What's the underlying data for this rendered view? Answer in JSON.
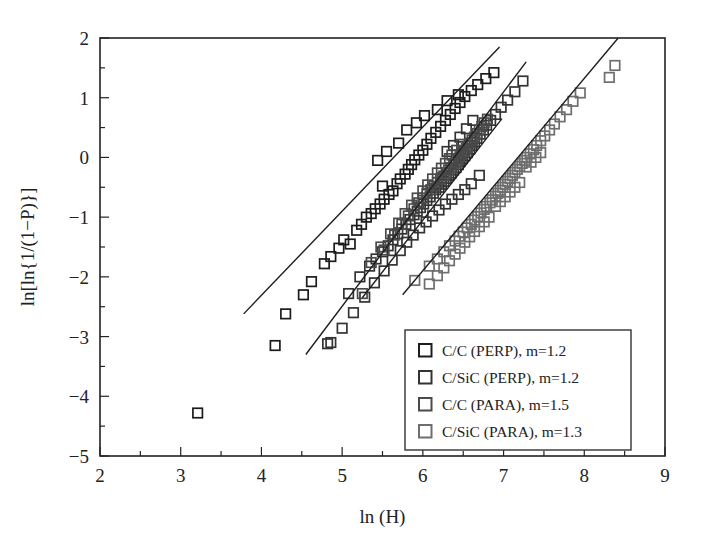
{
  "chart_data": {
    "type": "scatter",
    "title": "",
    "xlabel": "ln (H)",
    "ylabel": "ln[ln{1/(1−P)}]",
    "xlim": [
      2,
      9
    ],
    "ylim": [
      -5,
      2
    ],
    "xticks": [
      2,
      3,
      4,
      5,
      6,
      7,
      8,
      9
    ],
    "yticks": [
      -5,
      -4,
      -3,
      -2,
      -1,
      0,
      1,
      2
    ],
    "xtick_labels": [
      "2",
      "3",
      "4",
      "5",
      "6",
      "7",
      "8",
      "9"
    ],
    "ytick_labels": [
      "−5",
      "−4",
      "−3",
      "−2",
      "−1",
      "0",
      "1",
      "2"
    ],
    "minor_tick_step": 0.5,
    "grid": false,
    "legend_position": "lower-right",
    "marker": "open-square",
    "series": [
      {
        "name": "C/C (PERP), m=1.2",
        "label": "C/C (PERP), m=1.2",
        "weibull_modulus": 1.2,
        "color": "#1c1c1c",
        "fit_line": {
          "x": [
            3.78,
            6.95
          ],
          "y": [
            -2.62,
            1.85
          ],
          "slope": 1.41,
          "intercept": -7.95
        },
        "points": [
          [
            3.21,
            -4.28
          ],
          [
            4.17,
            -3.15
          ],
          [
            4.3,
            -2.62
          ],
          [
            4.52,
            -2.3
          ],
          [
            4.62,
            -2.08
          ],
          [
            4.78,
            -1.78
          ],
          [
            4.86,
            -1.66
          ],
          [
            4.96,
            -1.52
          ],
          [
            5.02,
            -1.38
          ],
          [
            5.1,
            -1.45
          ],
          [
            5.18,
            -1.22
          ],
          [
            5.24,
            -1.12
          ],
          [
            5.3,
            -1.0
          ],
          [
            5.36,
            -0.94
          ],
          [
            5.41,
            -0.86
          ],
          [
            5.47,
            -0.78
          ],
          [
            5.52,
            -0.7
          ],
          [
            5.5,
            -0.48
          ],
          [
            5.58,
            -0.62
          ],
          [
            5.63,
            -0.56
          ],
          [
            5.68,
            -0.44
          ],
          [
            5.72,
            -0.36
          ],
          [
            5.78,
            -0.28
          ],
          [
            5.82,
            -0.2
          ],
          [
            5.86,
            -0.12
          ],
          [
            5.9,
            -0.04
          ],
          [
            5.95,
            0.04
          ],
          [
            6.0,
            0.12
          ],
          [
            6.05,
            0.22
          ],
          [
            6.1,
            0.32
          ],
          [
            6.16,
            0.42
          ],
          [
            6.22,
            0.52
          ],
          [
            6.28,
            0.62
          ],
          [
            6.34,
            0.72
          ],
          [
            6.4,
            0.82
          ],
          [
            6.46,
            0.92
          ],
          [
            6.52,
            1.02
          ],
          [
            6.6,
            1.12
          ],
          [
            6.68,
            1.22
          ],
          [
            6.78,
            1.32
          ],
          [
            6.88,
            1.42
          ],
          [
            6.44,
            1.05
          ],
          [
            6.3,
            0.95
          ],
          [
            6.18,
            0.8
          ],
          [
            6.02,
            0.7
          ],
          [
            5.92,
            0.58
          ],
          [
            5.8,
            0.46
          ],
          [
            5.7,
            0.24
          ],
          [
            5.55,
            0.1
          ],
          [
            5.44,
            -0.05
          ]
        ]
      },
      {
        "name": "C/SiC (PERP), m=1.2",
        "label": "C/SiC (PERP), m=1.2",
        "weibull_modulus": 1.2,
        "color": "#333333",
        "fit_line": {
          "x": [
            4.55,
            7.28
          ],
          "y": [
            -3.3,
            1.6
          ],
          "slope": 1.79,
          "intercept": -11.47
        },
        "points": [
          [
            4.82,
            -3.12
          ],
          [
            5.08,
            -2.28
          ],
          [
            5.22,
            -2.0
          ],
          [
            5.34,
            -1.82
          ],
          [
            5.42,
            -1.7
          ],
          [
            5.5,
            -1.58
          ],
          [
            5.57,
            -1.48
          ],
          [
            5.63,
            -1.38
          ],
          [
            5.69,
            -1.28
          ],
          [
            5.74,
            -1.2
          ],
          [
            5.79,
            -1.12
          ],
          [
            5.84,
            -1.04
          ],
          [
            5.89,
            -0.96
          ],
          [
            5.93,
            -0.9
          ],
          [
            5.97,
            -0.84
          ],
          [
            6.01,
            -0.78
          ],
          [
            6.05,
            -0.72
          ],
          [
            6.09,
            -0.66
          ],
          [
            6.13,
            -0.6
          ],
          [
            6.16,
            -0.54
          ],
          [
            6.2,
            -0.5
          ],
          [
            6.23,
            -0.45
          ],
          [
            6.26,
            -0.4
          ],
          [
            6.29,
            -0.35
          ],
          [
            6.32,
            -0.3
          ],
          [
            6.35,
            -0.26
          ],
          [
            6.38,
            -0.21
          ],
          [
            6.41,
            -0.17
          ],
          [
            6.44,
            -0.12
          ],
          [
            6.46,
            -0.07
          ],
          [
            6.49,
            -0.02
          ],
          [
            6.52,
            0.03
          ],
          [
            6.55,
            0.08
          ],
          [
            6.58,
            0.14
          ],
          [
            6.61,
            0.2
          ],
          [
            6.64,
            0.26
          ],
          [
            6.67,
            0.32
          ],
          [
            6.71,
            0.39
          ],
          [
            6.75,
            0.46
          ],
          [
            6.79,
            0.54
          ],
          [
            6.84,
            0.62
          ],
          [
            6.9,
            0.72
          ],
          [
            6.97,
            0.84
          ],
          [
            7.05,
            0.96
          ],
          [
            7.14,
            1.1
          ],
          [
            7.24,
            1.28
          ],
          [
            6.7,
            -0.3
          ],
          [
            6.6,
            -0.44
          ],
          [
            6.52,
            -0.54
          ],
          [
            6.44,
            -0.62
          ],
          [
            6.36,
            -0.7
          ],
          [
            6.28,
            -0.78
          ],
          [
            6.2,
            -0.88
          ],
          [
            6.12,
            -0.98
          ],
          [
            6.04,
            -1.08
          ],
          [
            5.96,
            -1.18
          ],
          [
            5.88,
            -1.3
          ],
          [
            5.8,
            -1.42
          ],
          [
            5.72,
            -1.56
          ],
          [
            5.62,
            -1.72
          ],
          [
            5.52,
            -1.9
          ],
          [
            5.4,
            -2.1
          ],
          [
            5.28,
            -2.34
          ],
          [
            5.14,
            -2.6
          ],
          [
            5.0,
            -2.86
          ],
          [
            4.86,
            -3.1
          ],
          [
            6.3,
            0.1
          ],
          [
            6.38,
            0.2
          ],
          [
            6.46,
            0.34
          ],
          [
            6.54,
            0.48
          ],
          [
            6.62,
            0.62
          ]
        ]
      },
      {
        "name": "C/C (PARA), m=1.5",
        "label": "C/C (PARA), m=1.5",
        "weibull_modulus": 1.5,
        "color": "#4a4a4a",
        "fit_line": {
          "x": [
            5.25,
            6.98
          ],
          "y": [
            -2.35,
            0.65
          ],
          "slope": 1.73,
          "intercept": -11.44
        },
        "points": [
          [
            5.25,
            -2.28
          ],
          [
            5.52,
            -1.55
          ],
          [
            5.65,
            -1.3
          ],
          [
            5.74,
            -1.12
          ],
          [
            5.82,
            -0.98
          ],
          [
            5.89,
            -0.86
          ],
          [
            5.95,
            -0.76
          ],
          [
            6.0,
            -0.68
          ],
          [
            6.05,
            -0.6
          ],
          [
            6.1,
            -0.54
          ],
          [
            6.14,
            -0.48
          ],
          [
            6.18,
            -0.42
          ],
          [
            6.22,
            -0.36
          ],
          [
            6.26,
            -0.31
          ],
          [
            6.29,
            -0.26
          ],
          [
            6.32,
            -0.21
          ],
          [
            6.35,
            -0.17
          ],
          [
            6.38,
            -0.12
          ],
          [
            6.41,
            -0.08
          ],
          [
            6.44,
            -0.03
          ],
          [
            6.46,
            0.01
          ],
          [
            6.49,
            0.06
          ],
          [
            6.51,
            0.1
          ],
          [
            6.54,
            0.15
          ],
          [
            6.56,
            0.19
          ],
          [
            6.59,
            0.24
          ],
          [
            6.61,
            0.29
          ],
          [
            6.64,
            0.34
          ],
          [
            6.67,
            0.4
          ],
          [
            6.7,
            0.46
          ],
          [
            6.73,
            0.52
          ],
          [
            6.76,
            0.58
          ],
          [
            6.8,
            0.64
          ],
          [
            6.33,
            -0.02
          ],
          [
            6.28,
            -0.1
          ],
          [
            6.23,
            -0.18
          ],
          [
            6.18,
            -0.26
          ],
          [
            6.12,
            -0.36
          ],
          [
            6.06,
            -0.46
          ],
          [
            6.0,
            -0.56
          ],
          [
            5.93,
            -0.68
          ],
          [
            5.86,
            -0.8
          ],
          [
            5.78,
            -0.94
          ],
          [
            5.7,
            -1.1
          ],
          [
            5.6,
            -1.28
          ],
          [
            5.48,
            -1.5
          ],
          [
            5.36,
            -1.76
          ],
          [
            6.48,
            0.22
          ],
          [
            6.42,
            0.12
          ],
          [
            6.36,
            0.04
          ]
        ]
      },
      {
        "name": "C/SiC (PARA), m=1.3",
        "label": "C/SiC (PARA), m=1.3",
        "weibull_modulus": 1.3,
        "color": "#6e6e6e",
        "fit_line": {
          "x": [
            5.75,
            8.42
          ],
          "y": [
            -2.3,
            2.0
          ],
          "slope": 1.61,
          "intercept": -11.56
        },
        "points": [
          [
            5.9,
            -2.06
          ],
          [
            6.08,
            -1.82
          ],
          [
            6.18,
            -1.7
          ],
          [
            6.26,
            -1.58
          ],
          [
            6.33,
            -1.48
          ],
          [
            6.4,
            -1.4
          ],
          [
            6.45,
            -1.32
          ],
          [
            6.5,
            -1.25
          ],
          [
            6.55,
            -1.18
          ],
          [
            6.6,
            -1.12
          ],
          [
            6.64,
            -1.05
          ],
          [
            6.68,
            -0.99
          ],
          [
            6.72,
            -0.93
          ],
          [
            6.76,
            -0.87
          ],
          [
            6.79,
            -0.82
          ],
          [
            6.83,
            -0.76
          ],
          [
            6.86,
            -0.71
          ],
          [
            6.9,
            -0.65
          ],
          [
            6.93,
            -0.6
          ],
          [
            6.96,
            -0.55
          ],
          [
            6.99,
            -0.5
          ],
          [
            7.02,
            -0.45
          ],
          [
            7.05,
            -0.4
          ],
          [
            7.08,
            -0.35
          ],
          [
            7.11,
            -0.3
          ],
          [
            7.14,
            -0.25
          ],
          [
            7.17,
            -0.2
          ],
          [
            7.2,
            -0.15
          ],
          [
            7.23,
            -0.1
          ],
          [
            7.26,
            -0.05
          ],
          [
            7.29,
            0.0
          ],
          [
            7.33,
            0.06
          ],
          [
            7.37,
            0.13
          ],
          [
            7.41,
            0.2
          ],
          [
            7.46,
            0.28
          ],
          [
            7.51,
            0.36
          ],
          [
            7.57,
            0.46
          ],
          [
            7.63,
            0.56
          ],
          [
            7.7,
            0.68
          ],
          [
            7.78,
            0.8
          ],
          [
            7.86,
            0.94
          ],
          [
            7.95,
            1.08
          ],
          [
            8.31,
            1.34
          ],
          [
            8.38,
            1.54
          ],
          [
            6.82,
            -1.0
          ],
          [
            6.76,
            -1.08
          ],
          [
            6.7,
            -1.16
          ],
          [
            6.64,
            -1.24
          ],
          [
            6.58,
            -1.33
          ],
          [
            6.52,
            -1.42
          ],
          [
            6.46,
            -1.52
          ],
          [
            6.4,
            -1.62
          ],
          [
            6.33,
            -1.73
          ],
          [
            6.26,
            -1.85
          ],
          [
            6.18,
            -1.98
          ],
          [
            6.08,
            -2.12
          ],
          [
            7.2,
            -0.42
          ],
          [
            7.14,
            -0.5
          ],
          [
            7.08,
            -0.58
          ],
          [
            7.02,
            -0.66
          ],
          [
            6.96,
            -0.74
          ],
          [
            6.9,
            -0.82
          ],
          [
            7.46,
            0.08
          ],
          [
            7.4,
            0.0
          ],
          [
            7.34,
            -0.08
          ],
          [
            7.28,
            -0.16
          ]
        ]
      }
    ]
  }
}
